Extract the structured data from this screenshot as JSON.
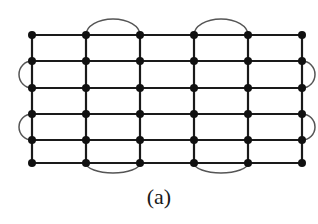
{
  "figure": {
    "caption": "(a)",
    "type": "grid graph with wraparound arc edges",
    "colors": {
      "edge": "#1a1a1a",
      "node": "#111111",
      "arc": "#555555",
      "background": "#ffffff"
    },
    "grid": {
      "columns_x": [
        32,
        86,
        140,
        194,
        248,
        302
      ],
      "rows_y": [
        35,
        61,
        88,
        114,
        140,
        163
      ],
      "node_radius": 4
    },
    "arcs": [
      {
        "side": "top",
        "from": [
          1,
          0
        ],
        "to": [
          2,
          0
        ]
      },
      {
        "side": "top",
        "from": [
          3,
          0
        ],
        "to": [
          4,
          0
        ]
      },
      {
        "side": "bottom",
        "from": [
          1,
          5
        ],
        "to": [
          2,
          5
        ]
      },
      {
        "side": "bottom",
        "from": [
          3,
          5
        ],
        "to": [
          4,
          5
        ]
      },
      {
        "side": "left",
        "from": [
          0,
          1
        ],
        "to": [
          0,
          2
        ]
      },
      {
        "side": "left",
        "from": [
          0,
          3
        ],
        "to": [
          0,
          4
        ]
      },
      {
        "side": "right",
        "from": [
          5,
          1
        ],
        "to": [
          5,
          2
        ]
      },
      {
        "side": "right",
        "from": [
          5,
          3
        ],
        "to": [
          5,
          4
        ]
      }
    ]
  }
}
